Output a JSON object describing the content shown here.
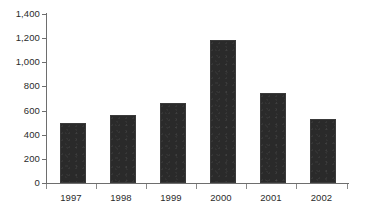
{
  "chart_data": {
    "type": "bar",
    "title": "",
    "subtitle": "",
    "xlabel": "",
    "ylabel": "",
    "categories": [
      "1997",
      "1998",
      "1999",
      "2000",
      "2001",
      "2002"
    ],
    "values": [
      500,
      560,
      660,
      1185,
      745,
      530
    ],
    "series": [
      {
        "name": "",
        "values": [
          500,
          560,
          660,
          1185,
          745,
          530
        ]
      }
    ],
    "ylim": [
      0,
      1400
    ],
    "yticks": [
      0,
      200,
      400,
      600,
      800,
      1000,
      1200,
      1400
    ],
    "ytick_labels": [
      "0",
      "200",
      "400",
      "600",
      "800",
      "1,000",
      "1,200",
      "1,400"
    ],
    "grid": false,
    "legend": false,
    "legend_position": "none",
    "annotations": [],
    "bar_color": "#2a2a2a",
    "axis_color": "#6e6e6e",
    "text_color": "#2b2b2b",
    "background_color": "#ffffff"
  }
}
